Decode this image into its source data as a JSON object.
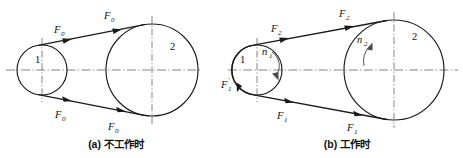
{
  "figure": {
    "type": "engineering-diagram",
    "panel_count": 2
  },
  "panels": [
    {
      "id": "a",
      "caption": "(a) 不工作时",
      "caption_marker": "(a)",
      "caption_text": "不工作时",
      "small_pulley_label": "1",
      "large_pulley_label": "2",
      "forces": [
        {
          "name": "F0-upper-left",
          "label": "F",
          "subscript": "0"
        },
        {
          "name": "F0-upper-right",
          "label": "F",
          "subscript": "0"
        },
        {
          "name": "F0-lower-left",
          "label": "F",
          "subscript": "0"
        },
        {
          "name": "F0-lower-right",
          "label": "F",
          "subscript": "0"
        }
      ]
    },
    {
      "id": "b",
      "caption": "(b) 工作时",
      "caption_marker": "(b)",
      "caption_text": "工作时",
      "small_pulley_label": "1",
      "large_pulley_label": "2",
      "speed_small": {
        "label": "n",
        "subscript": "1"
      },
      "speed_large": {
        "label": "n",
        "subscript": "2"
      },
      "forces": [
        {
          "name": "F2-upper-left",
          "label": "F",
          "subscript": "2"
        },
        {
          "name": "F2-upper-right",
          "label": "F",
          "subscript": "2"
        },
        {
          "name": "F1-lower-left",
          "label": "F",
          "subscript": "1"
        },
        {
          "name": "F1-lower-right",
          "label": "F",
          "subscript": "1"
        },
        {
          "name": "F1-prime-left",
          "label": "F",
          "subscript": "1",
          "prime": "'"
        }
      ]
    }
  ],
  "colors": {
    "line": "#1a1a1a",
    "centerline": "#6e6e6e",
    "text": "#111111",
    "background": "#ffffff"
  }
}
